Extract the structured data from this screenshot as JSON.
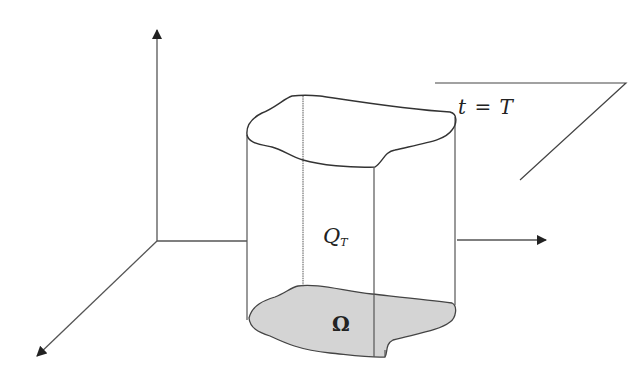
{
  "diagram": {
    "labels": {
      "time_plane": "t = T",
      "cylinder_main": "Q",
      "cylinder_sub": "T",
      "domain": "Ω"
    },
    "colors": {
      "stroke": "#444444",
      "domain_fill": "#d4d4d4",
      "background": "#ffffff"
    },
    "axes": [
      {
        "name": "vertical-axis",
        "direction": "up"
      },
      {
        "name": "horizontal-axis",
        "direction": "right"
      },
      {
        "name": "depth-axis",
        "direction": "down-left"
      }
    ]
  }
}
